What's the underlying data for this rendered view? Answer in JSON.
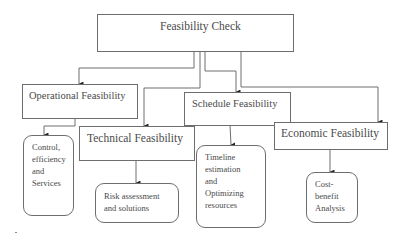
{
  "diagram": {
    "type": "hierarchy",
    "root": {
      "label": "Feasibility Check"
    },
    "nodes": [
      {
        "id": "operational",
        "label": "Operational Feasibility",
        "detail": [
          "Control,",
          "efficiency",
          "and",
          "Services"
        ]
      },
      {
        "id": "technical",
        "label": "Technical Feasibility",
        "detail": [
          "Risk assessment",
          "and solutions"
        ]
      },
      {
        "id": "schedule",
        "label": "Schedule Feasibility",
        "detail": [
          "Timeline",
          "estimation",
          "and",
          "Optimizing",
          "resources"
        ]
      },
      {
        "id": "economic",
        "label": "Economic Feasibility",
        "detail": [
          "Cost-",
          "benefit",
          "Analysis"
        ]
      }
    ],
    "colors": {
      "line": "#6e6e6e",
      "text": "#4a4a4a",
      "arrow": "#222222",
      "background": "#ffffff"
    }
  }
}
